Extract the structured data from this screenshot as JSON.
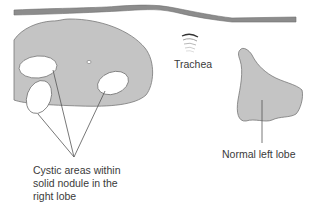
{
  "diagram": {
    "type": "anatomical-schematic",
    "colors": {
      "tissue_fill": "#c4c4c4",
      "outline": "#777777",
      "cyst_fill": "#ffffff",
      "skin_band": "#8c8c8c",
      "leader_line": "#555555",
      "text": "#3a3a3a",
      "background": "#ffffff"
    },
    "labels": {
      "trachea": "Trachea",
      "cystic_areas": {
        "line1": "Cystic areas within",
        "line2": "solid nodule in the",
        "line3": "right lobe"
      },
      "normal_left_lobe": "Normal left lobe"
    },
    "structures": [
      {
        "name": "skin-surface-band"
      },
      {
        "name": "right-lobe-solid-nodule",
        "cysts": 3
      },
      {
        "name": "trachea"
      },
      {
        "name": "normal-left-lobe"
      }
    ]
  }
}
